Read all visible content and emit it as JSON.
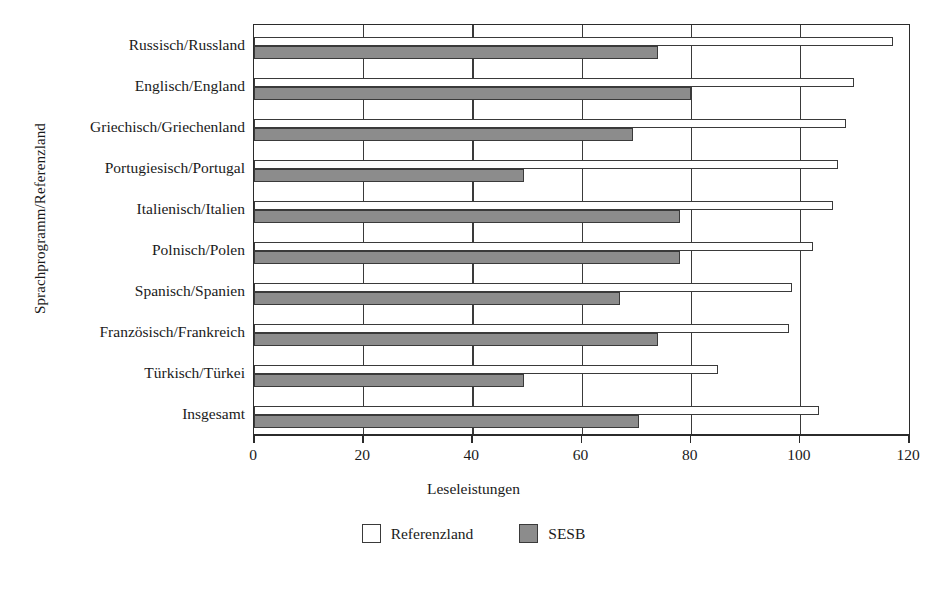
{
  "chart_data": {
    "type": "bar",
    "orientation": "horizontal",
    "title": "",
    "xlabel": "Leseleistungen",
    "ylabel": "Sprachprogramm/Referenzland",
    "xlim": [
      0,
      120
    ],
    "xticks": [
      0,
      20,
      40,
      60,
      80,
      100,
      120
    ],
    "xtick_labels": [
      "0",
      "20",
      "40",
      "60",
      "80",
      "100",
      "120"
    ],
    "grid": true,
    "grid_axis": "x",
    "legend_position": "bottom",
    "categories": [
      "Russisch/Russland",
      "Englisch/England",
      "Griechisch/Griechenland",
      "Portugiesisch/Portugal",
      "Italienisch/Italien",
      "Polnisch/Polen",
      "Spanisch/Spanien",
      "Französisch/Frankreich",
      "Türkisch/Türkei",
      "Insgesamt"
    ],
    "series": [
      {
        "name": "Referenzland",
        "color": "#ffffff",
        "values": [
          117,
          110,
          108.5,
          107,
          106,
          102.5,
          98.5,
          98,
          85,
          103.5
        ]
      },
      {
        "name": "SESB",
        "color": "#8c8c8c",
        "values": [
          74,
          80,
          69.5,
          49.5,
          78,
          78,
          67,
          74,
          49.5,
          70.5
        ]
      }
    ]
  },
  "legend": {
    "items": [
      {
        "label": "Referenzland",
        "swatch": "ref"
      },
      {
        "label": "SESB",
        "swatch": "sesb"
      }
    ]
  }
}
